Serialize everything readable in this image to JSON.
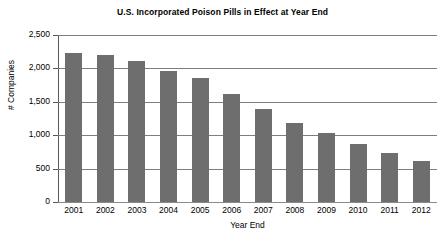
{
  "chart_data": {
    "type": "bar",
    "title": "U.S. Incorporated Poison Pills in Effect at Year End",
    "xlabel": "Year End",
    "ylabel": "# Companies",
    "categories": [
      "2001",
      "2002",
      "2003",
      "2004",
      "2005",
      "2006",
      "2007",
      "2008",
      "2009",
      "2010",
      "2011",
      "2012"
    ],
    "values": [
      2225,
      2205,
      2105,
      1965,
      1850,
      1620,
      1390,
      1190,
      1030,
      875,
      740,
      610
    ],
    "ylim": [
      0,
      2500
    ],
    "ytick_values": [
      0,
      500,
      1000,
      1500,
      2000,
      2500
    ],
    "ytick_labels": [
      "0",
      "500",
      "1,000",
      "1,500",
      "2,000",
      "2,500"
    ],
    "grid": true,
    "legend": false,
    "series": [
      {
        "name": "# Companies",
        "color": "#6e6e6e",
        "values": [
          2225,
          2205,
          2105,
          1965,
          1850,
          1620,
          1390,
          1190,
          1030,
          875,
          740,
          610
        ]
      }
    ]
  },
  "colors": {
    "bar": "#6e6e6e",
    "gridline": "#7d7d7d",
    "axis": "#5a5a5a",
    "background": "#ffffff",
    "text": "#000000"
  }
}
